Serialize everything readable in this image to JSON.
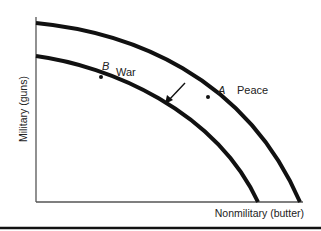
{
  "axes": {
    "y_label": "Military (guns)",
    "x_label": "Nonmilitary (butter)"
  },
  "curves": [
    {
      "name": "peace-frontier",
      "point_label": "A",
      "text": "Peace"
    },
    {
      "name": "war-frontier",
      "point_label": "B",
      "text": "War"
    }
  ],
  "annotation": "Arrow indicating inward shift of frontier from peace to war",
  "colors": {
    "line": "#111111",
    "axis": "#555555",
    "background": "#ffffff"
  }
}
